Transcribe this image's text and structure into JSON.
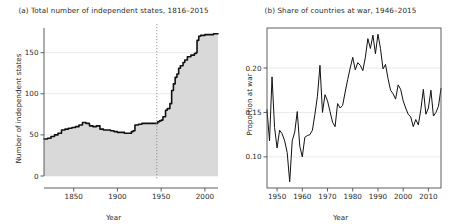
{
  "figure": {
    "panels": [
      {
        "key": "a",
        "title": "(a) Total number of independent states, 1816–2015",
        "xlabel": "Year",
        "ylabel": "Number of independent states"
      },
      {
        "key": "b",
        "title": "(b) Share of countries at war, 1946–2015",
        "xlabel": "Year",
        "ylabel": "Proportion at war"
      }
    ],
    "colors": {
      "line": "#111111",
      "area_fill": "#d9d9d9",
      "gridline": "#e8e8e8",
      "axis": "#4d4d4d",
      "marker_line": "#808080",
      "background": "#ffffff"
    }
  },
  "chart_data": [
    {
      "type": "area",
      "panel": "a",
      "title": "(a) Total number of independent states, 1816–2015",
      "xlabel": "Year",
      "ylabel": "Number of independent states",
      "xlim": [
        1816,
        2015
      ],
      "ylim": [
        0,
        180
      ],
      "xticks": [
        1850,
        1900,
        1950,
        2000
      ],
      "yticks": [
        0,
        50,
        100,
        150
      ],
      "grid": "horizontal",
      "annotations": [
        {
          "type": "vline",
          "x": 1945,
          "style": "dotted",
          "label": ""
        }
      ],
      "x": [
        1816,
        1820,
        1824,
        1828,
        1832,
        1836,
        1840,
        1844,
        1848,
        1852,
        1856,
        1860,
        1864,
        1868,
        1872,
        1876,
        1880,
        1884,
        1888,
        1892,
        1896,
        1900,
        1904,
        1908,
        1912,
        1916,
        1918,
        1920,
        1924,
        1928,
        1932,
        1936,
        1940,
        1944,
        1946,
        1948,
        1950,
        1952,
        1955,
        1957,
        1960,
        1962,
        1964,
        1966,
        1968,
        1970,
        1972,
        1975,
        1977,
        1980,
        1984,
        1988,
        1990,
        1991,
        1993,
        1995,
        2000,
        2005,
        2010,
        2015
      ],
      "y": [
        45,
        46,
        48,
        50,
        52,
        56,
        57,
        58,
        59,
        60,
        62,
        65,
        64,
        61,
        60,
        61,
        57,
        56,
        56,
        55,
        54,
        53,
        53,
        52,
        52,
        54,
        55,
        62,
        63,
        64,
        64,
        64,
        64,
        64,
        66,
        67,
        68,
        72,
        80,
        82,
        88,
        104,
        112,
        120,
        124,
        131,
        134,
        138,
        141,
        145,
        147,
        149,
        150,
        165,
        170,
        171,
        172,
        172,
        173,
        173
      ]
    },
    {
      "type": "line",
      "panel": "b",
      "title": "(b) Share of countries at war, 1946–2015",
      "xlabel": "Year",
      "ylabel": "Proportion at war",
      "xlim": [
        1946,
        2015
      ],
      "ylim": [
        0.065,
        0.245
      ],
      "xticks": [
        1950,
        1960,
        1970,
        1980,
        1990,
        2000,
        2010
      ],
      "yticks": [
        0.1,
        0.15,
        0.2
      ],
      "grid": "horizontal",
      "x": [
        1946,
        1947,
        1948,
        1949,
        1950,
        1951,
        1952,
        1953,
        1954,
        1955,
        1956,
        1957,
        1958,
        1959,
        1960,
        1961,
        1962,
        1963,
        1964,
        1965,
        1966,
        1967,
        1968,
        1969,
        1970,
        1971,
        1972,
        1973,
        1974,
        1975,
        1976,
        1977,
        1978,
        1979,
        1980,
        1981,
        1982,
        1983,
        1984,
        1985,
        1986,
        1987,
        1988,
        1989,
        1990,
        1991,
        1992,
        1993,
        1994,
        1995,
        1996,
        1997,
        1998,
        1999,
        2000,
        2001,
        2002,
        2003,
        2004,
        2005,
        2006,
        2007,
        2008,
        2009,
        2010,
        2011,
        2012,
        2013,
        2014,
        2015
      ],
      "y": [
        0.153,
        0.118,
        0.19,
        0.133,
        0.11,
        0.13,
        0.126,
        0.118,
        0.105,
        0.072,
        0.118,
        0.128,
        0.151,
        0.112,
        0.1,
        0.122,
        0.124,
        0.125,
        0.13,
        0.148,
        0.168,
        0.203,
        0.15,
        0.17,
        0.163,
        0.151,
        0.139,
        0.134,
        0.16,
        0.155,
        0.158,
        0.173,
        0.187,
        0.2,
        0.212,
        0.198,
        0.206,
        0.203,
        0.197,
        0.212,
        0.233,
        0.222,
        0.237,
        0.216,
        0.238,
        0.222,
        0.199,
        0.204,
        0.188,
        0.175,
        0.171,
        0.165,
        0.181,
        0.176,
        0.163,
        0.155,
        0.148,
        0.145,
        0.134,
        0.142,
        0.136,
        0.153,
        0.176,
        0.148,
        0.155,
        0.175,
        0.146,
        0.15,
        0.157,
        0.177
      ]
    }
  ]
}
